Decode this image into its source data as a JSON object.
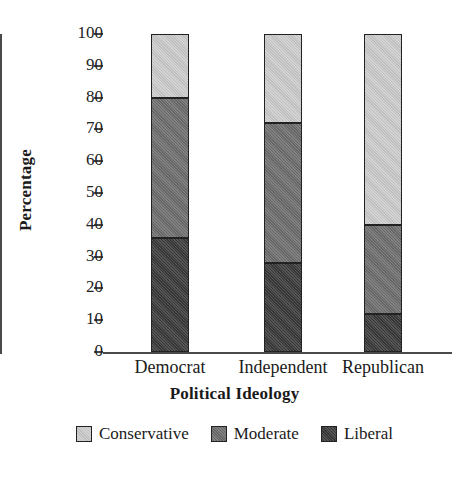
{
  "chart_data": {
    "type": "bar",
    "subtype": "stacked-100-percent",
    "title": "",
    "xlabel": "Political Ideology",
    "ylabel": "Percentage",
    "categories": [
      "Democrat",
      "Independent",
      "Republican"
    ],
    "series": [
      {
        "name": "Conservative",
        "color": "#cdcdcd",
        "values": [
          20,
          28,
          60
        ]
      },
      {
        "name": "Moderate",
        "color": "#6e6e6e",
        "values": [
          44,
          44,
          28
        ]
      },
      {
        "name": "Liberal",
        "color": "#3a3a3a",
        "values": [
          36,
          28,
          12
        ]
      }
    ],
    "stack_order_bottom_to_top": [
      "Liberal",
      "Moderate",
      "Conservative"
    ],
    "cumulative_tops": {
      "Democrat": {
        "liberal": 36,
        "moderate": 80,
        "conservative": 100
      },
      "Independent": {
        "liberal": 28,
        "moderate": 72,
        "conservative": 100
      },
      "Republican": {
        "liberal": 12,
        "moderate": 40,
        "conservative": 100
      }
    },
    "ylim": [
      0,
      100
    ],
    "ytick_labels": [
      "100",
      "90",
      "80",
      "70",
      "60",
      "50",
      "40",
      "30",
      "20",
      "10",
      "0"
    ],
    "ytick_values": [
      100,
      90,
      80,
      70,
      60,
      50,
      40,
      30,
      20,
      10,
      0
    ],
    "ytick_step": 10,
    "grid": false,
    "legend_position": "bottom-center",
    "legend_entries": [
      "Conservative",
      "Moderate",
      "Liberal"
    ],
    "axis_color": "#4a4a4a",
    "bar_outline_color": "#222222",
    "background": "#ffffff"
  }
}
